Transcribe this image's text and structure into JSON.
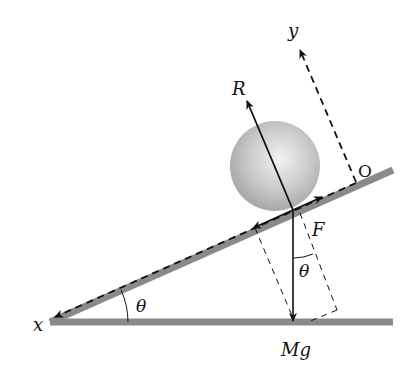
{
  "diagram": {
    "type": "free-body diagram",
    "labels": {
      "x_axis": "x",
      "y_axis": "y",
      "origin": "O",
      "normal_force": "R",
      "friction": "F",
      "weight": "Mg",
      "angle_incline": "θ",
      "angle_weight": "θ"
    },
    "colors": {
      "surface": "#8a8a8a",
      "ball_light": "#efefef",
      "ball_dark": "#a9a9a9",
      "line": "#111111"
    }
  }
}
